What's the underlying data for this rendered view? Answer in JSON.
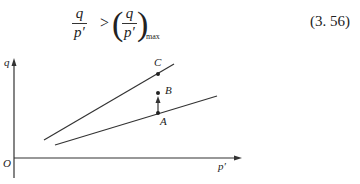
{
  "equation": {
    "lhs_numerator": "q",
    "lhs_denominator": "p′",
    "operator": ">",
    "rhs_numerator": "q",
    "rhs_denominator": "p′",
    "rhs_subscript": "max",
    "number": "(3. 56)"
  },
  "figure": {
    "y_axis_label": "q",
    "x_axis_label": "p′",
    "origin_label": "O",
    "points": [
      {
        "label": "C",
        "description": "point on upper (failure) line"
      },
      {
        "label": "B",
        "description": "point above A"
      },
      {
        "label": "A",
        "description": "point on lower line"
      }
    ]
  }
}
